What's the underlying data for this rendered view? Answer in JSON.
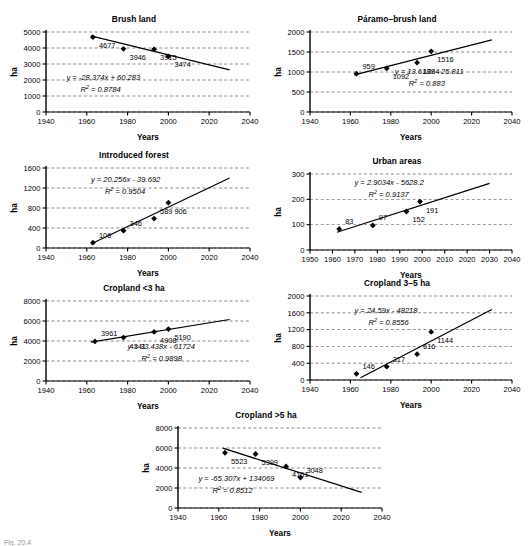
{
  "figure": {
    "caption": "Fig. 20.4",
    "axis_y_label": "ha",
    "axis_x_label": "Years"
  },
  "chart_data": [
    {
      "id": "brush-land",
      "type": "scatter",
      "title": "Brush land",
      "xlabel": "Years",
      "ylabel": "ha",
      "xlim": [
        1940,
        2040
      ],
      "ylim": [
        0,
        5000
      ],
      "xticks": [
        1940,
        1960,
        1980,
        2000,
        2020,
        2040
      ],
      "yticks": [
        0,
        1000,
        2000,
        3000,
        4000,
        5000
      ],
      "grid": true,
      "legend": "none",
      "x": [
        1963,
        1978,
        1993,
        2000
      ],
      "values": [
        4677,
        3946,
        3915,
        3474
      ],
      "point_labels": [
        "4677",
        "3946",
        "3915",
        "3474"
      ],
      "equation": "y = -28.374x + 60.283",
      "r_squared": "R2 = 0.8784",
      "trend": {
        "slope": -28.374,
        "x_start": 1962,
        "y_start": 4760,
        "x_end": 2030,
        "y_end": 2630
      }
    },
    {
      "id": "paramo-brush-land",
      "type": "scatter",
      "title": "Páramo–brush land",
      "xlabel": "Years",
      "ylabel": "ha",
      "xlim": [
        1940,
        2040
      ],
      "ylim": [
        0,
        2000
      ],
      "xticks": [
        1940,
        1960,
        1980,
        2000,
        2020,
        2040
      ],
      "yticks": [
        0,
        500,
        1000,
        1500,
        2000
      ],
      "grid": true,
      "legend": "none",
      "x": [
        1963,
        1978,
        1993,
        2000
      ],
      "values": [
        959,
        1092,
        1234,
        1516
      ],
      "point_labels": [
        "959",
        "1092",
        "1234",
        "1516"
      ],
      "equation": "y = 13.618x - 25.811",
      "r_squared": "R2 = 0.883",
      "trend": {
        "slope": 13.618,
        "x_start": 1962,
        "y_start": 930,
        "x_end": 2030,
        "y_end": 1805
      }
    },
    {
      "id": "introduced-forest",
      "type": "scatter",
      "title": "Introduced forest",
      "xlabel": "Years",
      "ylabel": "ha",
      "xlim": [
        1940,
        2040
      ],
      "ylim": [
        0,
        1600
      ],
      "xticks": [
        1940,
        1960,
        1980,
        2000,
        2020,
        2040
      ],
      "yticks": [
        0,
        400,
        800,
        1200,
        1600
      ],
      "grid": true,
      "legend": "none",
      "x": [
        1963,
        1978,
        1993,
        2000
      ],
      "values": [
        106,
        346,
        589,
        906
      ],
      "point_labels": [
        "106",
        "346",
        "589",
        "906"
      ],
      "equation": "y = 20.256x - 39.692",
      "r_squared": "R2 = 0.9504",
      "trend": {
        "slope": 20.256,
        "x_start": 1962,
        "y_start": 80,
        "x_end": 2030,
        "y_end": 1400
      }
    },
    {
      "id": "urban-areas",
      "type": "scatter",
      "title": "Urban areas",
      "xlabel": "Years",
      "ylabel": "ha",
      "xlim": [
        1950,
        2040
      ],
      "ylim": [
        0,
        300
      ],
      "xticks": [
        1950,
        1960,
        1970,
        1980,
        1990,
        2000,
        2010,
        2020,
        2030,
        2040
      ],
      "yticks": [
        0,
        100,
        200,
        300
      ],
      "grid": true,
      "legend": "none",
      "x": [
        1963,
        1978,
        1993,
        1999
      ],
      "values": [
        83,
        97,
        152,
        191
      ],
      "point_labels": [
        "83",
        "97",
        "152",
        "191"
      ],
      "equation": "y = 2.9034x - 5628.2",
      "r_squared": "R2 = 0.9137",
      "trend": {
        "slope": 2.9034,
        "x_start": 1962,
        "y_start": 70,
        "x_end": 2030,
        "y_end": 263
      }
    },
    {
      "id": "cropland-lt-3-ha",
      "type": "scatter",
      "title": "Cropland <3 ha",
      "xlabel": "Years",
      "ylabel": "ha",
      "xlim": [
        1940,
        2040
      ],
      "ylim": [
        0,
        8000
      ],
      "xticks": [
        1940,
        1960,
        1980,
        2000,
        2020,
        2040
      ],
      "yticks": [
        0,
        2000,
        4000,
        6000,
        8000
      ],
      "grid": true,
      "legend": "none",
      "x": [
        1964,
        1978,
        1993,
        2000
      ],
      "values": [
        3961,
        4341,
        4908,
        5190
      ],
      "point_labels": [
        "3961",
        "4341",
        "4908",
        "5190"
      ],
      "equation": "y = 33.438x - 61724",
      "r_squared": "R2 = 0.9898",
      "trend": {
        "slope": 33.438,
        "x_start": 1962,
        "y_start": 3880,
        "x_end": 2030,
        "y_end": 6150
      }
    },
    {
      "id": "cropland-3-5-ha",
      "type": "scatter",
      "title": "Cropland 3–5 ha",
      "xlabel": "Years",
      "ylabel": "ha",
      "xlim": [
        1940,
        2040
      ],
      "ylim": [
        0,
        2000
      ],
      "xticks": [
        1940,
        1960,
        1980,
        2000,
        2020,
        2040
      ],
      "yticks": [
        0,
        400,
        800,
        1200,
        1600,
        2000
      ],
      "grid": true,
      "legend": "none",
      "x": [
        1963,
        1978,
        1993,
        2000
      ],
      "values": [
        146,
        317,
        616,
        1144
      ],
      "point_labels": [
        "146",
        "317",
        "616",
        "1144"
      ],
      "equation": "y = 24.59x - 48218",
      "r_squared": "R2 = 0.8556",
      "trend": {
        "slope": 24.59,
        "x_start": 1965,
        "y_start": 55,
        "x_end": 2030,
        "y_end": 1680
      }
    },
    {
      "id": "cropland-gt-5-ha",
      "type": "scatter",
      "title": "Cropland >5 ha",
      "xlabel": "Years",
      "ylabel": "ha",
      "xlim": [
        1940,
        2040
      ],
      "ylim": [
        0,
        8000
      ],
      "xticks": [
        1940,
        1960,
        1980,
        2000,
        2020,
        2040
      ],
      "yticks": [
        0,
        2000,
        4000,
        6000,
        8000
      ],
      "grid": true,
      "legend": "none",
      "x": [
        1963,
        1978,
        1993,
        2000
      ],
      "values": [
        5523,
        5399,
        4161,
        3048
      ],
      "point_labels": [
        "5523",
        "5399",
        "4161",
        "3048"
      ],
      "equation": "y = -65.307x + 134069",
      "r_squared": "R2 = 0.8512",
      "trend": {
        "slope": -65.307,
        "x_start": 1962,
        "y_start": 5980,
        "x_end": 2030,
        "y_end": 1560
      }
    }
  ],
  "panels": [
    {
      "id": "brush-land",
      "left": 8,
      "top": 14,
      "w": 252,
      "h": 130
    },
    {
      "id": "paramo-brush-land",
      "left": 272,
      "top": 14,
      "w": 250,
      "h": 130
    },
    {
      "id": "introduced-forest",
      "left": 8,
      "top": 150,
      "w": 252,
      "h": 130
    },
    {
      "id": "urban-areas",
      "left": 272,
      "top": 156,
      "w": 250,
      "h": 126
    },
    {
      "id": "cropland-lt-3-ha",
      "left": 8,
      "top": 283,
      "w": 252,
      "h": 130
    },
    {
      "id": "cropland-3-5-ha",
      "left": 272,
      "top": 278,
      "w": 250,
      "h": 134
    },
    {
      "id": "cropland-gt-5-ha",
      "left": 140,
      "top": 410,
      "w": 252,
      "h": 130
    }
  ]
}
